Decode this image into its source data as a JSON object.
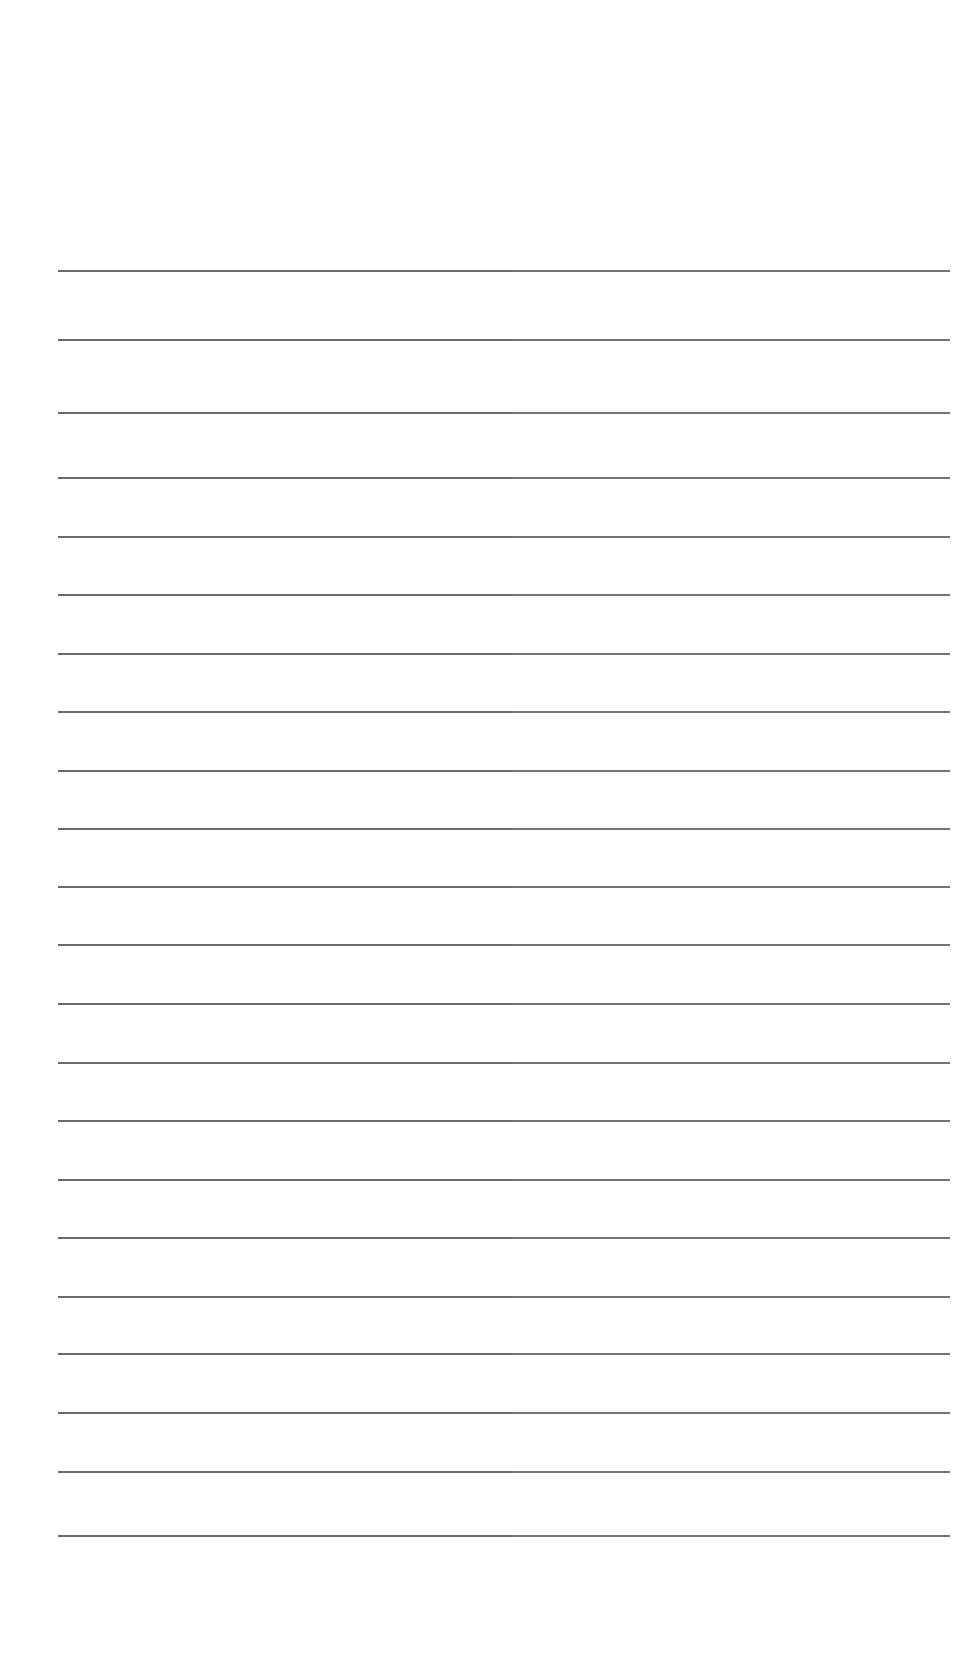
{
  "document": {
    "type": "lined-paper",
    "background_color": "#ffffff",
    "rule_color": "#5a5a5a",
    "rule_left_x": 58,
    "rule_right_x": 950,
    "rule_thickness": 2,
    "rule_y_positions": [
      271,
      340,
      413,
      478,
      537,
      595,
      654,
      712,
      771,
      829,
      887,
      945,
      1004,
      1063,
      1121,
      1180,
      1238,
      1297,
      1354,
      1413,
      1472,
      1536
    ],
    "rule_count": 22
  }
}
